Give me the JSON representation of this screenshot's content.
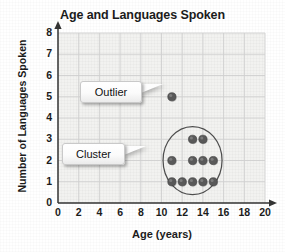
{
  "chart_data": {
    "type": "scatter",
    "title": "Age and Languages Spoken",
    "xlabel": "Age (years)",
    "ylabel": "Number of Languages Spoken",
    "xlim": [
      0,
      20
    ],
    "ylim": [
      0,
      8
    ],
    "xticks": [
      0,
      2,
      4,
      6,
      8,
      10,
      12,
      14,
      16,
      18,
      20
    ],
    "yticks": [
      0,
      1,
      2,
      3,
      4,
      5,
      6,
      7,
      8
    ],
    "grid": true,
    "legend": null,
    "points": [
      {
        "x": 11,
        "y": 5,
        "group": "outlier"
      },
      {
        "x": 13,
        "y": 3,
        "group": "cluster"
      },
      {
        "x": 14,
        "y": 3,
        "group": "cluster"
      },
      {
        "x": 11,
        "y": 2,
        "group": "cluster"
      },
      {
        "x": 13,
        "y": 2,
        "group": "cluster"
      },
      {
        "x": 14,
        "y": 2,
        "group": "cluster"
      },
      {
        "x": 15,
        "y": 2,
        "group": "cluster"
      },
      {
        "x": 11,
        "y": 1,
        "group": "cluster"
      },
      {
        "x": 12,
        "y": 1,
        "group": "cluster"
      },
      {
        "x": 13,
        "y": 1,
        "group": "cluster"
      },
      {
        "x": 14,
        "y": 1,
        "group": "cluster"
      },
      {
        "x": 15,
        "y": 1,
        "group": "cluster"
      }
    ],
    "annotations": [
      {
        "label": "Outlier",
        "target_x": 11,
        "target_y": 5
      },
      {
        "label": "Cluster",
        "target_x": 13,
        "target_y": 2
      }
    ],
    "shapes": [
      {
        "type": "ellipse",
        "center_x": 13,
        "center_y": 2,
        "radius_x": 2.85,
        "radius_y": 1.6
      }
    ],
    "colors": {
      "marker": "#595959",
      "plot_background": "#f2f2f0",
      "grid": "#cfcfcf",
      "axis": "#333333",
      "ellipse": "#4d4d4d",
      "text": "#1b1b1b"
    }
  }
}
